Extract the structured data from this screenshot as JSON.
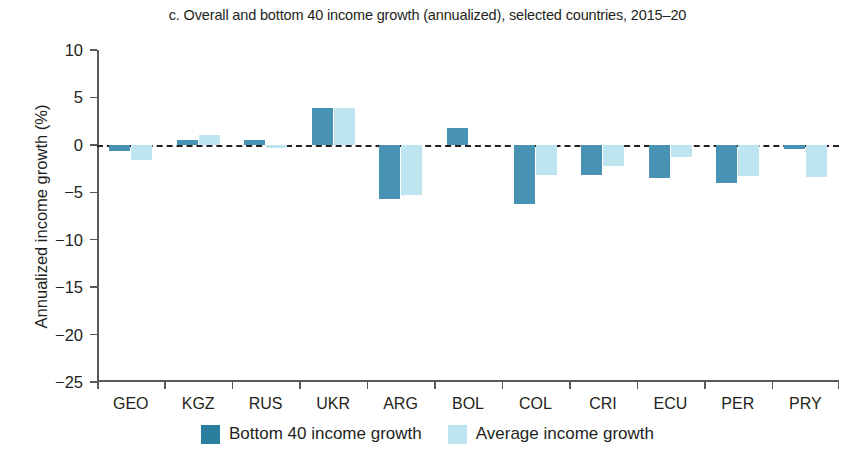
{
  "chart_data": {
    "type": "bar",
    "title": "c. Overall and bottom 40 income growth (annualized), selected countries, 2015–20",
    "xlabel": "",
    "ylabel": "Annualized income growth (%)",
    "ylim": [
      -25,
      10
    ],
    "ytick_labels": [
      "10",
      "5",
      "0",
      "−5",
      "−10",
      "−15",
      "−20",
      "−25"
    ],
    "ytick_values": [
      10,
      5,
      0,
      -5,
      -10,
      -15,
      -20,
      -25
    ],
    "grid": false,
    "zero_line": true,
    "legend_position": "bottom",
    "categories": [
      "GEO",
      "KGZ",
      "RUS",
      "UKR",
      "ARG",
      "BOL",
      "COL",
      "CRI",
      "ECU",
      "PER",
      "PRY"
    ],
    "series": [
      {
        "name": "Bottom 40 income growth",
        "color": "#4893b4",
        "values": [
          -0.6,
          0.5,
          0.5,
          3.9,
          -5.7,
          1.8,
          -6.2,
          -3.2,
          -3.5,
          -4.0,
          -0.4
        ]
      },
      {
        "name": "Average income growth",
        "color": "#bde4ef",
        "values": [
          -1.6,
          1.0,
          -0.3,
          3.9,
          -5.3,
          0.0,
          -3.2,
          -2.2,
          -1.3,
          -3.3,
          -3.4
        ]
      }
    ]
  }
}
